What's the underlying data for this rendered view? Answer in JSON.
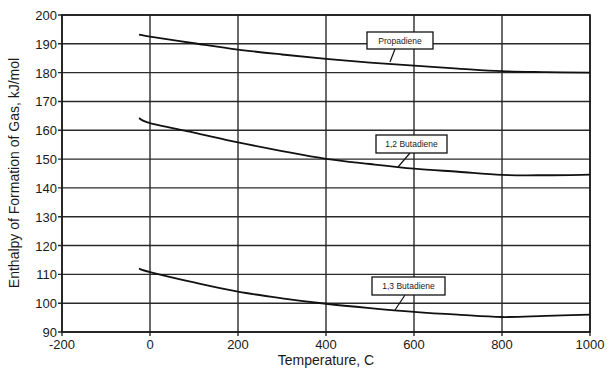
{
  "chart_data": {
    "type": "line",
    "title": "",
    "xlabel": "Temperature, C",
    "ylabel": "Enthalpy of Formation of Gas, kJ/mol",
    "xlim": [
      -200,
      1000
    ],
    "ylim": [
      90,
      200
    ],
    "xticks": [
      -200,
      0,
      200,
      400,
      600,
      800,
      1000
    ],
    "yticks": [
      90,
      100,
      110,
      120,
      130,
      140,
      150,
      160,
      170,
      180,
      190,
      200
    ],
    "grid": true,
    "legend": "inline labels",
    "x": [
      -25,
      0,
      100,
      200,
      300,
      400,
      500,
      600,
      700,
      800,
      900,
      1000
    ],
    "series": [
      {
        "name": "Propadiene",
        "values": [
          193.2,
          192.5,
          190.2,
          188.0,
          186.3,
          184.8,
          183.5,
          182.4,
          181.4,
          180.5,
          180.2,
          180.0
        ],
        "label_box": {
          "x": 367,
          "y": 32,
          "w": 66,
          "h": 17
        },
        "leader": [
          [
            395,
            49
          ],
          [
            390,
            62
          ]
        ]
      },
      {
        "name": "1,2 Butadiene",
        "values": [
          164.2,
          162.5,
          159.2,
          155.8,
          152.8,
          150.1,
          148.3,
          146.7,
          145.6,
          144.5,
          144.4,
          144.6
        ],
        "label_box": {
          "x": 376,
          "y": 135,
          "w": 71,
          "h": 18
        },
        "leader": [
          [
            410,
            153
          ],
          [
            398,
            167
          ]
        ]
      },
      {
        "name": "1,3 Butadiene",
        "values": [
          112.0,
          110.8,
          107.2,
          104.0,
          101.7,
          99.8,
          98.3,
          97.0,
          96.0,
          95.2,
          95.6,
          96.0
        ],
        "label_box": {
          "x": 372,
          "y": 277,
          "w": 73,
          "h": 18
        },
        "leader": [
          [
            405,
            295
          ],
          [
            395,
            310
          ]
        ]
      }
    ]
  }
}
